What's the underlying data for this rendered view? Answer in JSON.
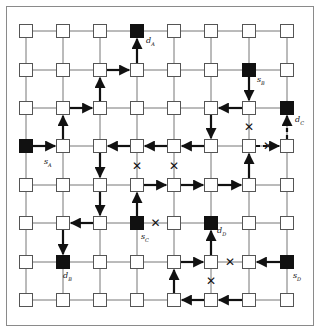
{
  "diagram": {
    "title": "",
    "grid": {
      "cols": 8,
      "rows": 8,
      "col_x": [
        26,
        63,
        100,
        137,
        174,
        211,
        249,
        287
      ],
      "row_y": [
        31,
        70,
        108,
        146,
        185,
        223,
        262,
        300
      ]
    },
    "colors": {
      "node_fill": "#ffffff",
      "node_stroke": "#555555",
      "terminal_fill": "#111111",
      "link": "#777777",
      "path": "#111111"
    },
    "terminals": [
      {
        "id": "sA",
        "name": "s",
        "sub": "A",
        "col": 0,
        "row": 3,
        "lx": 18,
        "ly": 18
      },
      {
        "id": "dA",
        "name": "d",
        "sub": "A",
        "col": 3,
        "row": 0,
        "lx": 9,
        "ly": 12
      },
      {
        "id": "sB",
        "name": "s",
        "sub": "B",
        "col": 6,
        "row": 1,
        "lx": 8,
        "ly": 12
      },
      {
        "id": "dB",
        "name": "d",
        "sub": "B",
        "col": 1,
        "row": 6,
        "lx": 0,
        "ly": 16
      },
      {
        "id": "sC",
        "name": "s",
        "sub": "C",
        "col": 3,
        "row": 5,
        "lx": 4,
        "ly": 16
      },
      {
        "id": "dC",
        "name": "d",
        "sub": "C",
        "col": 7,
        "row": 2,
        "lx": 8,
        "ly": 14
      },
      {
        "id": "sD",
        "name": "s",
        "sub": "D",
        "col": 7,
        "row": 6,
        "lx": 6,
        "ly": 16
      },
      {
        "id": "dD",
        "name": "d",
        "sub": "D",
        "col": 5,
        "row": 5,
        "lx": 6,
        "ly": 10
      }
    ],
    "paths": [
      {
        "name": "A",
        "segments": [
          [
            0,
            3,
            1,
            3
          ],
          [
            1,
            3,
            1,
            2
          ],
          [
            1,
            2,
            2,
            2
          ],
          [
            2,
            2,
            2,
            1
          ],
          [
            2,
            1,
            3,
            1
          ],
          [
            3,
            1,
            3,
            0
          ]
        ]
      },
      {
        "name": "B",
        "segments": [
          [
            6,
            1,
            6,
            2
          ],
          [
            6,
            2,
            5,
            2
          ],
          [
            5,
            2,
            5,
            3
          ],
          [
            5,
            3,
            4,
            3
          ],
          [
            4,
            3,
            3,
            3
          ],
          [
            3,
            3,
            2,
            3
          ],
          [
            2,
            3,
            2,
            4
          ],
          [
            2,
            4,
            2,
            5
          ],
          [
            2,
            5,
            1,
            5
          ],
          [
            1,
            5,
            1,
            6
          ]
        ]
      },
      {
        "name": "C",
        "segments": [
          [
            3,
            5,
            3,
            4
          ],
          [
            3,
            4,
            4,
            4
          ],
          [
            4,
            4,
            5,
            4
          ],
          [
            5,
            4,
            6,
            4
          ],
          [
            6,
            4,
            6,
            3
          ]
        ],
        "dashed_segments": [
          [
            6,
            3,
            7,
            3
          ],
          [
            7,
            3,
            7,
            2
          ]
        ]
      },
      {
        "name": "D",
        "segments": [
          [
            7,
            6,
            6,
            6
          ],
          [
            6,
            7,
            5,
            7
          ],
          [
            5,
            7,
            4,
            7
          ],
          [
            4,
            7,
            4,
            6
          ],
          [
            4,
            6,
            5,
            6
          ],
          [
            5,
            6,
            5,
            5
          ]
        ]
      }
    ],
    "blocked_links": [
      {
        "between": [
          3,
          3,
          3,
          4
        ]
      },
      {
        "between": [
          4,
          3,
          4,
          4
        ]
      },
      {
        "between": [
          6,
          2,
          6,
          3
        ]
      },
      {
        "between": [
          6,
          3,
          7,
          3
        ]
      },
      {
        "between": [
          3,
          5,
          4,
          5
        ]
      },
      {
        "between": [
          5,
          6,
          6,
          6
        ]
      },
      {
        "between": [
          5,
          6,
          5,
          7
        ]
      }
    ],
    "blocked_symbol": "✕"
  }
}
